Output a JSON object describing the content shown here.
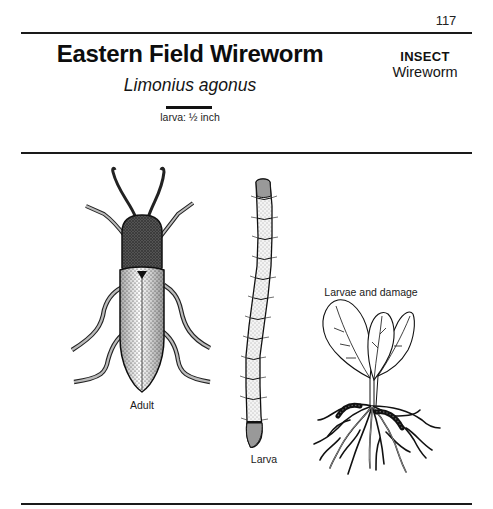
{
  "page": {
    "number": "117"
  },
  "header": {
    "title": "Eastern Field Wireworm",
    "scientific_name": "Limonius agonus",
    "scale": {
      "label": "larva: ½ inch"
    },
    "category": "INSECT",
    "subcategory": "Wireworm"
  },
  "illustrations": {
    "adult": {
      "caption": "Adult",
      "icon": "beetle-illustration"
    },
    "larva": {
      "caption": "Larva",
      "icon": "larva-illustration"
    },
    "damage": {
      "caption": "Larvae and damage",
      "icon": "plant-root-damage-illustration"
    }
  },
  "colors": {
    "ink": "#111111",
    "paper": "#ffffff"
  }
}
